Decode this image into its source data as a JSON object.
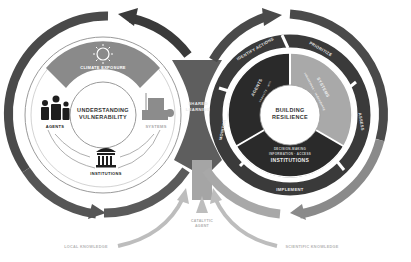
{
  "left_cycle": {
    "title_line1": "UNDERSTANDING",
    "title_line2": "VULNERABILITY",
    "top_segment": "CLIMATE EXPOSURE",
    "nodes": [
      {
        "label": "AGENTS",
        "icon": "people-icon"
      },
      {
        "label": "SYSTEMS",
        "icon": "factory-icon"
      },
      {
        "label": "INSTITUTIONS",
        "icon": "institution-building-icon"
      }
    ]
  },
  "center": {
    "label_line1": "SHARED",
    "label_line2": "LEARNING"
  },
  "right_cycle": {
    "title_line1": "BUILDING",
    "title_line2": "RESILIENCE",
    "inner_segments": [
      {
        "label": "AGENTS",
        "sub": "capacity · will",
        "color": "#2a2a2a"
      },
      {
        "label": "SYSTEMS",
        "sub": "robustness · redundancy",
        "color": "#a9a9a9"
      },
      {
        "label": "INSTITUTIONS",
        "sub1": "DECISION-MAKING",
        "sub2": "INFORMATION · ACCESS",
        "color": "#2a2a2a"
      }
    ],
    "process_steps": [
      "IDENTIFY ACTIONS",
      "PRIORITIZE",
      "ASSESS",
      "IMPLEMENT",
      "MONITOR"
    ]
  },
  "bottom": {
    "catalytic_line1": "CATALYTIC",
    "catalytic_line2": "AGENT",
    "left_input": "LOCAL KNOWLEDGE",
    "right_input": "SCIENTIFIC KNOWLEDGE"
  },
  "colors": {
    "dark": "#3a3a3a",
    "mid": "#6e6e6e",
    "light": "#a8a8a8",
    "pale": "#c4c4c4"
  }
}
